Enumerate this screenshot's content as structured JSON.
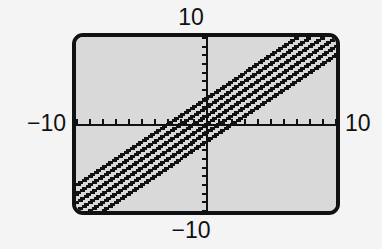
{
  "device": {
    "kind": "graphing-calculator-screen",
    "screen_bg": "#d9d9d9",
    "page_bg": "#f4f4f4",
    "ink": "#111111"
  },
  "labels": {
    "top": "10",
    "bottom": "−10",
    "left": "−10",
    "right": "10"
  },
  "chart_data": {
    "type": "line",
    "title": "",
    "xlabel": "",
    "ylabel": "",
    "xlim": [
      -10,
      10
    ],
    "ylim": [
      -10,
      10
    ],
    "x_tick_labels": [
      "−10",
      "10"
    ],
    "y_tick_labels": [
      "−10",
      "10"
    ],
    "xtick_step": 1,
    "ytick_step": 1,
    "grid": false,
    "legend": "none",
    "axes_drawn": true,
    "axis_color": "#111111",
    "line_color": "#111111",
    "pixelated_rendering": true,
    "x": [
      -10,
      10
    ],
    "series": [
      {
        "name": "y = x + 3",
        "slope": 1,
        "intercept": 3,
        "values": [
          -7,
          13
        ]
      },
      {
        "name": "y = x + 2",
        "slope": 1,
        "intercept": 2,
        "values": [
          -8,
          12
        ]
      },
      {
        "name": "y = x + 1",
        "slope": 1,
        "intercept": 1,
        "values": [
          -9,
          11
        ]
      },
      {
        "name": "y = x",
        "slope": 1,
        "intercept": 0,
        "values": [
          -10,
          10
        ]
      },
      {
        "name": "y = x - 1",
        "slope": 1,
        "intercept": -1,
        "values": [
          -11,
          9
        ]
      },
      {
        "name": "y = x - 2",
        "slope": 1,
        "intercept": -2,
        "values": [
          -12,
          8
        ]
      }
    ]
  }
}
